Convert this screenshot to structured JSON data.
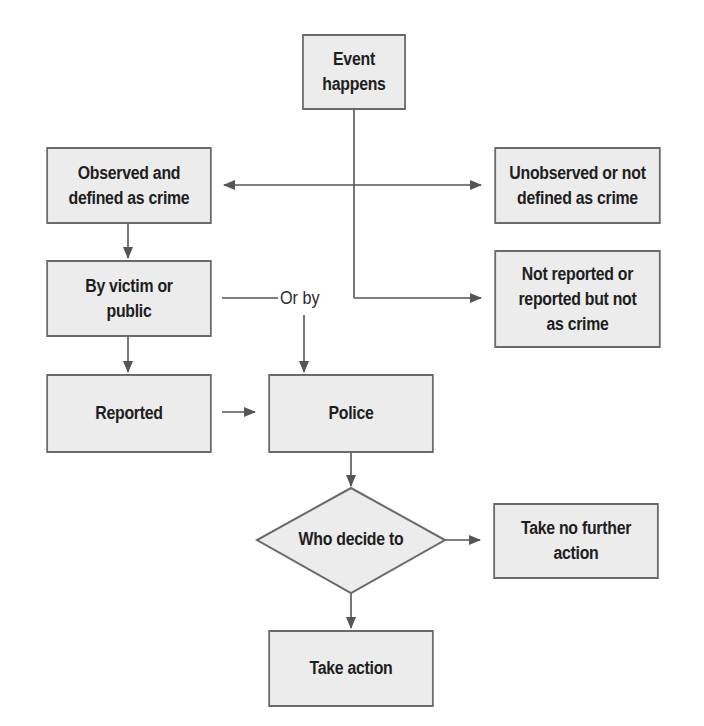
{
  "diagram": {
    "type": "flowchart",
    "colors": {
      "box_fill": "#ececec",
      "box_border": "#6a6a6a",
      "line": "#555555",
      "text": "#1e1e1e"
    },
    "nodes": {
      "event": {
        "label": "Event\nhappens"
      },
      "observed": {
        "label": "Observed and\ndefined as crime"
      },
      "unobserved": {
        "label": "Unobserved or not\ndefined as crime"
      },
      "victim": {
        "label": "By victim or\npublic"
      },
      "not_reported": {
        "label": "Not reported or\nreported but not\nas crime"
      },
      "reported": {
        "label": "Reported"
      },
      "police": {
        "label": "Police"
      },
      "decide": {
        "label": "Who decide to"
      },
      "no_action": {
        "label": "Take no further\naction"
      },
      "action": {
        "label": "Take action"
      }
    },
    "edge_labels": {
      "or_by": "Or by"
    },
    "edges": [
      {
        "from": "event",
        "to": "observed"
      },
      {
        "from": "event",
        "to": "unobserved"
      },
      {
        "from": "event",
        "to": "not_reported"
      },
      {
        "from": "observed",
        "to": "victim"
      },
      {
        "from": "victim",
        "to": "reported"
      },
      {
        "from": "victim",
        "to": "police",
        "label": "Or by"
      },
      {
        "from": "reported",
        "to": "police"
      },
      {
        "from": "police",
        "to": "decide"
      },
      {
        "from": "decide",
        "to": "no_action"
      },
      {
        "from": "decide",
        "to": "action"
      }
    ]
  }
}
